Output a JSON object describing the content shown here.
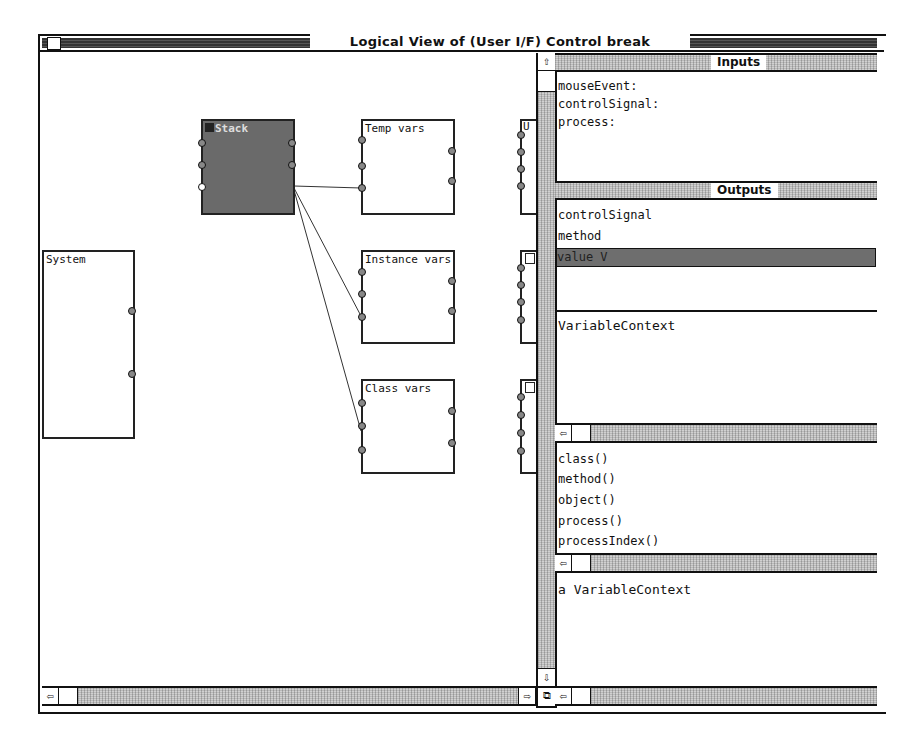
{
  "window": {
    "title": "Logical View of (User I/F) Control break"
  },
  "canvas": {
    "nodes": [
      {
        "label": "Stack",
        "selected": true
      },
      {
        "label": "Temp vars"
      },
      {
        "label": "Instance vars"
      },
      {
        "label": "Class vars"
      },
      {
        "label": "System"
      }
    ],
    "edge_stubs": [
      "U",
      "",
      ""
    ]
  },
  "inputs": {
    "header": "Inputs",
    "items": [
      "mouseEvent:",
      "controlSignal:",
      "process:"
    ]
  },
  "outputs": {
    "header": "Outputs",
    "items": [
      "controlSignal",
      "method",
      "value V"
    ],
    "selected_index": 2
  },
  "context": {
    "class_name": "VariableContext"
  },
  "methods": {
    "items": [
      "class()",
      "method()",
      "object()",
      "process()",
      "processIndex()"
    ]
  },
  "inspector": {
    "value": "a VariableContext"
  },
  "icons": {
    "arrow_up": "⇧",
    "arrow_down": "⇩",
    "arrow_left": "⇦",
    "arrow_right": "⇨",
    "grow": "⧉"
  },
  "colors": {
    "selected_node": "#6a6a6a",
    "scroll_track": "#b9b9b9",
    "selection": "#6e6e6e"
  }
}
